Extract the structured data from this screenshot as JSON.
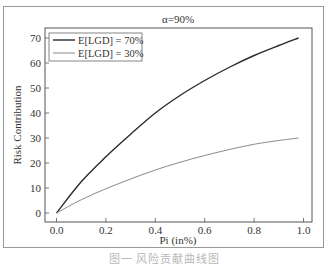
{
  "chart_data": {
    "type": "line",
    "title": "α=90%",
    "xlabel": "Pi (in%)",
    "ylabel": "Risk Contribution",
    "xlim": [
      -0.05,
      1.04
    ],
    "ylim": [
      -3,
      74
    ],
    "xticks": [
      "0.0",
      "0.2",
      "0.4",
      "0.6",
      "0.8",
      "1.0"
    ],
    "yticks": [
      "0",
      "10",
      "20",
      "30",
      "40",
      "50",
      "60",
      "70"
    ],
    "grid": false,
    "legend_position": "upper left",
    "x": [
      0.0,
      0.1,
      0.2,
      0.3,
      0.4,
      0.5,
      0.6,
      0.7,
      0.8,
      0.9,
      0.98
    ],
    "series": [
      {
        "name": "E[LGD] = 70%",
        "color": "#2a2a2a",
        "width": 1.4,
        "values": [
          0,
          12.5,
          22.5,
          31.5,
          40,
          47,
          53,
          58.3,
          63,
          67,
          70
        ]
      },
      {
        "name": "E[LGD] = 30%",
        "color": "#8a8a8a",
        "width": 1.0,
        "values": [
          0,
          5.3,
          9.7,
          13.6,
          17.2,
          20.3,
          23,
          25.4,
          27.5,
          29,
          30
        ]
      }
    ]
  },
  "caption": "图一  风险贡献曲线图"
}
